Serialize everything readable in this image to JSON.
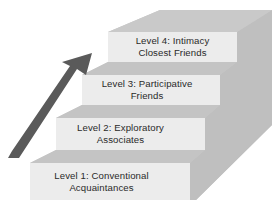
{
  "diagram": {
    "type": "staircase",
    "colors": {
      "front_face": "#ececec",
      "tread": "#c4c4c4",
      "side": "#bdbdbd",
      "back": "#c8c8c8",
      "arrow": "#5a5a5a",
      "text": "#2a2a2a"
    },
    "arrow": {
      "direction": "up",
      "meaning": "increasing closeness"
    },
    "levels": [
      {
        "level": 1,
        "title": "Level 1:  Conventional",
        "subtitle": "Acquaintances"
      },
      {
        "level": 2,
        "title": "Level 2:  Exploratory",
        "subtitle": "Associates"
      },
      {
        "level": 3,
        "title": "Level 3:  Participative",
        "subtitle": "Friends"
      },
      {
        "level": 4,
        "title": "Level 4:  Intimacy",
        "subtitle": "Closest Friends"
      }
    ]
  }
}
